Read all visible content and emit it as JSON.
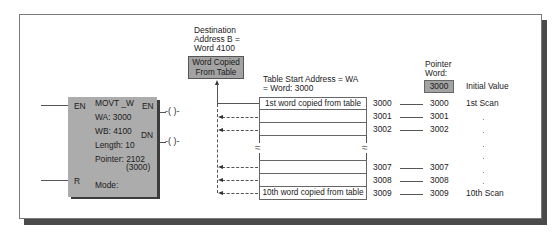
{
  "frame": {
    "border_color": "#7a7a7a",
    "shadow_color": "#4a4a4a"
  },
  "function_block": {
    "name": "MOVT _W",
    "input_en": "EN",
    "input_r": "R",
    "output_en": "EN",
    "output_dn": "DN",
    "wa": "WA: 3000",
    "wb": "WB: 4100",
    "length": "Length: 10",
    "pointer": "Pointer: 2102",
    "pointer_value": "(3000)",
    "mode": "Mode:",
    "coil_symbol": "-( )-",
    "fill_color": "#acacac"
  },
  "destination": {
    "label_line1": "Destination",
    "label_line2": "Address B =",
    "label_line3": "Word 4100",
    "box_line1": "Word Copied",
    "box_line2": "From Table"
  },
  "table": {
    "start_label_line1": "Table Start Address = WA",
    "start_label_line2": "= Word: 3000",
    "first_row": "1st word copied from table",
    "last_row": "10th word copied from table",
    "break_symbol": "≈",
    "addresses": [
      "3000",
      "3001",
      "3002",
      "3007",
      "3008",
      "3009"
    ]
  },
  "pointer_word": {
    "label_line1": "Pointer",
    "label_line2": "Word:",
    "initial_box": "3000",
    "initial_label": "Initial Value",
    "values": [
      "3000",
      "3001",
      "3002",
      "3007",
      "3008",
      "3009"
    ],
    "first_scan": "1st Scan",
    "last_scan": "10th Scan",
    "ellipsis_dot": "."
  }
}
